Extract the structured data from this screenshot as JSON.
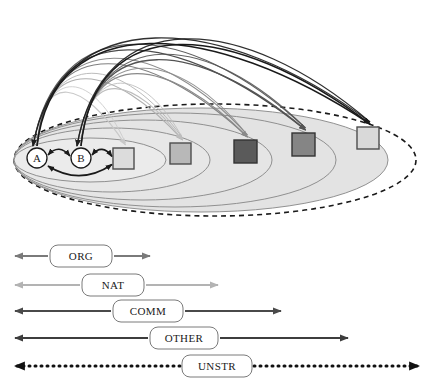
{
  "figure": {
    "nodes": [
      {
        "id": "A",
        "label": "A",
        "shape": "circle",
        "cx": 37,
        "cy": 158,
        "r": 10,
        "fill": "#ffffff",
        "stroke": "#1a1a1a"
      },
      {
        "id": "B",
        "label": "B",
        "shape": "circle",
        "cx": 81,
        "cy": 158,
        "r": 10,
        "fill": "#ffffff",
        "stroke": "#1a1a1a"
      }
    ],
    "squares": [
      {
        "id": "sq1",
        "x": 113,
        "y": 148,
        "size": 21,
        "fill": "#dcdcdc",
        "stroke": "#4d4d4d"
      },
      {
        "id": "sq2",
        "x": 170,
        "y": 143,
        "size": 21,
        "fill": "#b8b8b8",
        "stroke": "#4d4d4d"
      },
      {
        "id": "sq3",
        "x": 234,
        "y": 140,
        "size": 23,
        "fill": "#5a5a5a",
        "stroke": "#333333"
      },
      {
        "id": "sq4",
        "x": 292,
        "y": 133,
        "size": 23,
        "fill": "#858585",
        "stroke": "#333333"
      },
      {
        "id": "sq5",
        "x": 357,
        "y": 127,
        "size": 22,
        "fill": "#d9d9d9",
        "stroke": "#4d4d4d"
      }
    ],
    "ellipses": [
      {
        "id": "ring1",
        "cx": 90,
        "cy": 160,
        "rx": 76,
        "ry": 22,
        "stroke": "#8c8c8c",
        "dashed": false,
        "fill": "#ececec"
      },
      {
        "id": "ring2",
        "cx": 112,
        "cy": 160,
        "rx": 98,
        "ry": 32,
        "stroke": "#8c8c8c",
        "dashed": false,
        "fill": "#e8e8e8"
      },
      {
        "id": "ring3",
        "cx": 143,
        "cy": 160,
        "rx": 129,
        "ry": 40,
        "stroke": "#8c8c8c",
        "dashed": false,
        "fill": "#e6e6e6"
      },
      {
        "id": "ring4",
        "cx": 175,
        "cy": 160,
        "rx": 161,
        "ry": 47,
        "stroke": "#8c8c8c",
        "dashed": false,
        "fill": "#e4e4e4"
      },
      {
        "id": "ring5",
        "cx": 201,
        "cy": 160,
        "rx": 187,
        "ry": 52,
        "stroke": "#8c8c8c",
        "dashed": false,
        "fill": "#e2e2e2"
      },
      {
        "id": "ring6",
        "cx": 215,
        "cy": 160,
        "rx": 201,
        "ry": 56,
        "stroke": "#1a1a1a",
        "dashed": true,
        "fill": "none"
      }
    ],
    "local_arrows": [
      {
        "id": "a-to-b",
        "from": "A",
        "to": "B",
        "style": "double",
        "color": "#1a1a1a"
      },
      {
        "id": "b-to-sq1",
        "from": "B",
        "to": "sq1",
        "style": "double",
        "color": "#1a1a1a"
      },
      {
        "id": "a-to-sq1",
        "from": "A",
        "to": "sq1",
        "style": "double",
        "color": "#1a1a1a"
      }
    ],
    "arcs": [
      {
        "id": "arc-a-sq1",
        "from": "A",
        "to": "sq1",
        "color": "#c9c9c9",
        "width": 1.1
      },
      {
        "id": "arc-a-sq2",
        "from": "A",
        "to": "sq2",
        "color": "#b0b0b0",
        "width": 1.1
      },
      {
        "id": "arc-a-sq3",
        "from": "A",
        "to": "sq3",
        "color": "#808080",
        "width": 1.2
      },
      {
        "id": "arc-a-sq4",
        "from": "A",
        "to": "sq4",
        "color": "#4d4d4d",
        "width": 1.3
      },
      {
        "id": "arc-a-sq5",
        "from": "A",
        "to": "sq5",
        "color": "#1a1a1a",
        "width": 1.5
      },
      {
        "id": "arc-b-sq2",
        "from": "B",
        "to": "sq2",
        "color": "#bdbdbd",
        "width": 1.1
      },
      {
        "id": "arc-b-sq3",
        "from": "B",
        "to": "sq3",
        "color": "#8a8a8a",
        "width": 1.2
      },
      {
        "id": "arc-b-sq4",
        "from": "B",
        "to": "sq4",
        "color": "#545454",
        "width": 1.3
      },
      {
        "id": "arc-b-sq5",
        "from": "B",
        "to": "sq5",
        "color": "#1a1a1a",
        "width": 1.5
      }
    ]
  },
  "legend": {
    "rows": [
      {
        "id": "org",
        "label": "ORG",
        "x_start": 15,
        "x_end": 150,
        "y": 256,
        "box_x": 50,
        "box_w": 62,
        "color": "#7a7a7a",
        "width": 1.8,
        "dotted": false
      },
      {
        "id": "nat",
        "label": "NAT",
        "x_start": 15,
        "x_end": 218,
        "y": 285,
        "box_x": 82,
        "box_w": 62,
        "color": "#b3b3b3",
        "width": 1.8,
        "dotted": false
      },
      {
        "id": "comm",
        "label": "COMM",
        "x_start": 15,
        "x_end": 281,
        "y": 311,
        "box_x": 113,
        "box_w": 70,
        "color": "#4a4a4a",
        "width": 2.1,
        "dotted": false
      },
      {
        "id": "other",
        "label": "OTHER",
        "x_start": 15,
        "x_end": 348,
        "y": 338,
        "box_x": 150,
        "box_w": 68,
        "color": "#3d3d3d",
        "width": 2.1,
        "dotted": false
      },
      {
        "id": "unstr",
        "label": "UNSTR",
        "x_start": 15,
        "x_end": 419,
        "y": 366,
        "box_x": 182,
        "box_w": 70,
        "color": "#111111",
        "width": 3.0,
        "dotted": true
      }
    ],
    "box_fill": "#ffffff",
    "box_stroke": "#7a7a7a",
    "box_height": 22,
    "box_radius": 8
  }
}
